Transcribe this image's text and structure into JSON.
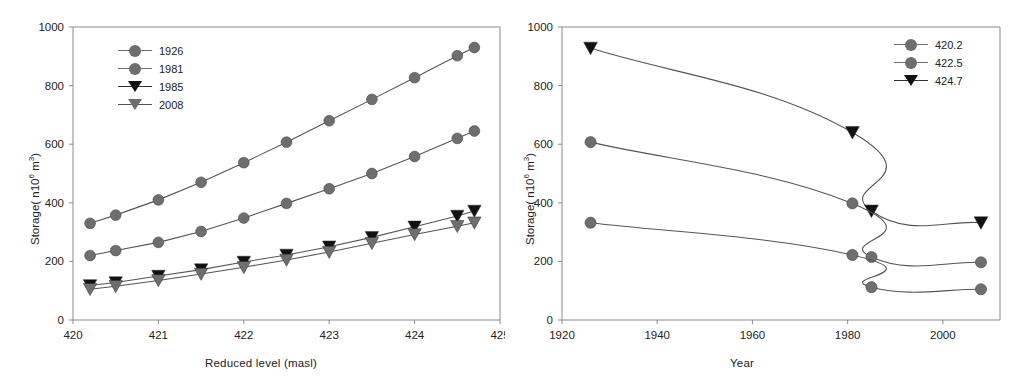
{
  "figure": {
    "background": "#ffffff",
    "line_color": "#555555",
    "marker_gray": "#6e6e6e",
    "marker_black": "#111111",
    "axis_color": "#8a8a8a"
  },
  "panels": [
    {
      "id": "left",
      "xlabel": "Reduced level (masl)",
      "ylabel_main": "Storage( n10",
      "ylabel_sup": "6",
      "ylabel_tail": " m",
      "ylabel_sup2": "3",
      "ylabel_end": ")",
      "ylabel_full": "Storage( n10⁶ m³)",
      "xticks": [
        "420",
        "421",
        "422",
        "423",
        "424",
        "425"
      ],
      "xtickvals": [
        420,
        421,
        422,
        423,
        424,
        425
      ],
      "yticks": [
        "0",
        "200",
        "400",
        "600",
        "800",
        "1000"
      ],
      "ytickvals": [
        0,
        200,
        400,
        600,
        800,
        1000
      ],
      "legend": [
        {
          "label": "1926",
          "marker": "circle",
          "color": "#6e6e6e"
        },
        {
          "label": "1981",
          "marker": "circle",
          "color": "#6e6e6e"
        },
        {
          "label": "1985",
          "marker": "triangle-down",
          "color": "#111111"
        },
        {
          "label": "2008",
          "marker": "triangle-down",
          "color": "#6e6e6e"
        }
      ]
    },
    {
      "id": "right",
      "xlabel": "Year",
      "ylabel_full": "Storage( n10⁶ m³)",
      "xticks": [
        "1920",
        "1940",
        "1960",
        "1980",
        "2000"
      ],
      "xtickvals": [
        1920,
        1940,
        1960,
        1980,
        2000
      ],
      "yticks": [
        "0",
        "200",
        "400",
        "600",
        "800",
        "1000"
      ],
      "ytickvals": [
        0,
        200,
        400,
        600,
        800,
        1000
      ],
      "legend": [
        {
          "label": "420.2",
          "marker": "circle",
          "color": "#6e6e6e"
        },
        {
          "label": "422.5",
          "marker": "circle",
          "color": "#6e6e6e"
        },
        {
          "label": "424.7",
          "marker": "triangle-down",
          "color": "#111111"
        }
      ]
    }
  ],
  "chart_data": [
    {
      "type": "line",
      "panel": "left",
      "title": "",
      "xlabel": "Reduced level (masl)",
      "ylabel": "Storage( n10⁶ m³)",
      "xlim": [
        420,
        425
      ],
      "ylim": [
        0,
        1000
      ],
      "grid": false,
      "legend_position": "upper-left",
      "x": [
        420.2,
        420.5,
        421.0,
        421.5,
        422.0,
        422.5,
        423.0,
        423.5,
        424.0,
        424.5,
        424.7
      ],
      "series": [
        {
          "name": "1926",
          "marker": "circle",
          "color": "#6e6e6e",
          "values": [
            330,
            358,
            410,
            470,
            537,
            607,
            680,
            753,
            827,
            902,
            930
          ]
        },
        {
          "name": "1981",
          "marker": "circle",
          "color": "#6e6e6e",
          "values": [
            220,
            237,
            265,
            302,
            348,
            398,
            448,
            500,
            558,
            620,
            645
          ]
        },
        {
          "name": "1985",
          "marker": "triangle-down",
          "color": "#111111",
          "values": [
            118,
            128,
            150,
            172,
            198,
            222,
            250,
            282,
            318,
            355,
            372
          ]
        },
        {
          "name": "2008",
          "marker": "triangle-down",
          "color": "#6e6e6e",
          "values": [
            105,
            115,
            135,
            157,
            180,
            205,
            232,
            262,
            292,
            320,
            332
          ]
        }
      ]
    },
    {
      "type": "line",
      "panel": "right",
      "title": "",
      "xlabel": "Year",
      "ylabel": "Storage( n10⁶ m³)",
      "xlim": [
        1920,
        2012
      ],
      "ylim": [
        0,
        1000
      ],
      "grid": false,
      "legend_position": "upper-right",
      "x": [
        1926,
        1981,
        1985,
        2008
      ],
      "series": [
        {
          "name": "424.7",
          "marker": "triangle-down",
          "color": "#111111",
          "values": [
            928,
            640,
            372,
            332
          ]
        },
        {
          "name": "422.5",
          "marker": "circle",
          "color": "#6e6e6e",
          "values": [
            607,
            398,
            215,
            197
          ]
        },
        {
          "name": "420.2",
          "marker": "circle",
          "color": "#6e6e6e",
          "values": [
            332,
            222,
            112,
            105
          ]
        }
      ]
    }
  ]
}
